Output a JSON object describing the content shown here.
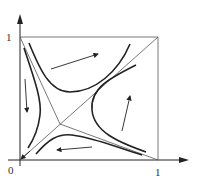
{
  "diagram": {
    "type": "phase-portrait",
    "axes": {
      "x_tick_0": "0",
      "x_tick_1": "1",
      "y_tick_1": "1"
    },
    "colors": {
      "line": "#222222",
      "thin_line": "#555555",
      "background": "#ffffff"
    },
    "elements": [
      "x-axis with arrow",
      "y-axis with arrow",
      "unit square boundary",
      "diagonal from (0,0) to (1,1)",
      "separatrix from (0,1) to saddle to (1,0)",
      "saddle point near (0.3,0.3)",
      "hyperbolic trajectories in four sectors",
      "flow arrows"
    ]
  }
}
